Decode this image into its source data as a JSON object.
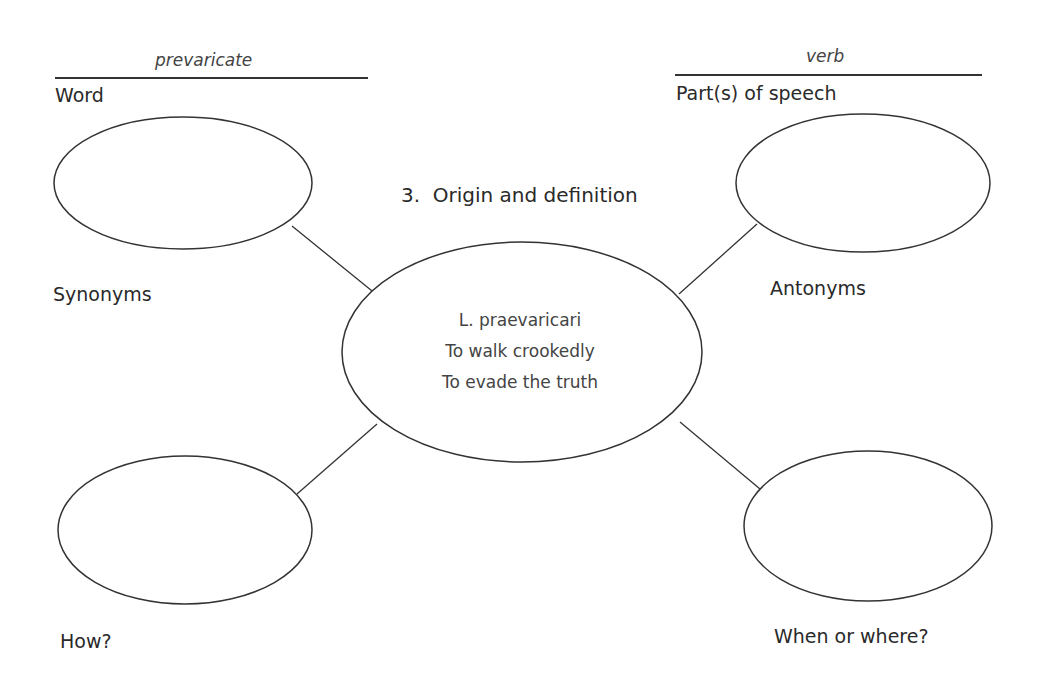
{
  "word": {
    "value": "prevaricate",
    "label": "Word"
  },
  "part_of_speech": {
    "value": "verb",
    "label": "Part(s) of speech"
  },
  "center_heading": "3.  Origin and definition",
  "center": {
    "lines": [
      "L. praevaricari",
      "To walk crookedly",
      "To evade the truth"
    ]
  },
  "nodes": {
    "synonyms": "Synonyms",
    "antonyms": "Antonyms",
    "how": "How?",
    "when_where": "When or where?"
  }
}
